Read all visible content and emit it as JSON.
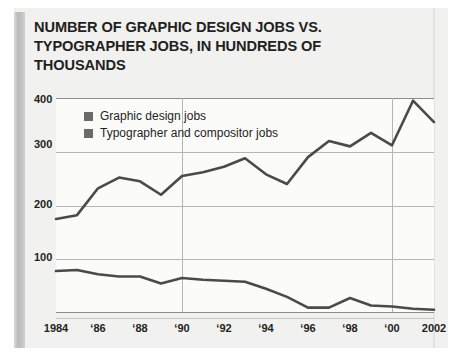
{
  "title": "NUMBER OF GRAPHIC DESIGN JOBS VS. TYPOGRAPHER JOBS, IN HUNDREDS OF THOUSANDS",
  "legend": {
    "items": [
      {
        "label": "Graphic design jobs",
        "color": "#6a6a6a"
      },
      {
        "label": "Typographer and compositor jobs",
        "color": "#6a6a6a"
      }
    ]
  },
  "axes": {
    "y_ticks": [
      "400",
      "300",
      "200",
      "100"
    ],
    "x_ticks": [
      "1984",
      "‘86",
      "‘88",
      "‘90",
      "‘92",
      "‘94",
      "‘96",
      "‘98",
      "‘00",
      "2002"
    ]
  },
  "chart_data": {
    "type": "line",
    "title": "NUMBER OF GRAPHIC DESIGN JOBS VS. TYPOGRAPHER JOBS, IN HUNDREDS OF THOUSANDS",
    "xlabel": "",
    "ylabel": "",
    "ylim": [
      0,
      400
    ],
    "xlim": [
      1984,
      2002
    ],
    "grid": true,
    "legend_position": "top-left",
    "yticks": [
      100,
      200,
      300,
      400
    ],
    "xticks": [
      1984,
      1986,
      1988,
      1990,
      1992,
      1994,
      1996,
      1998,
      2000,
      2002
    ],
    "xticklabels": [
      "1984",
      "'86",
      "'88",
      "'90",
      "'92",
      "'94",
      "'96",
      "'98",
      "'00",
      "2002"
    ],
    "vertical_gridlines": [
      1990,
      2000
    ],
    "x": [
      1984,
      1985,
      1986,
      1987,
      1988,
      1989,
      1990,
      1991,
      1992,
      1993,
      1994,
      1995,
      1996,
      1997,
      1998,
      1999,
      2000,
      2001,
      2002
    ],
    "series": [
      {
        "name": "Graphic design jobs",
        "color": "#4a4a4a",
        "values": [
          175,
          182,
          232,
          252,
          245,
          220,
          255,
          262,
          272,
          288,
          258,
          240,
          290,
          320,
          310,
          335,
          312,
          395,
          355
        ]
      },
      {
        "name": "Typographer and compositor jobs",
        "color": "#4a4a4a",
        "values": [
          78,
          80,
          72,
          68,
          68,
          55,
          65,
          62,
          60,
          58,
          45,
          30,
          10,
          10,
          28,
          14,
          12,
          8,
          6
        ]
      }
    ]
  }
}
